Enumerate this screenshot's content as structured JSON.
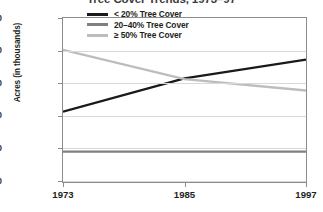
{
  "chart_data": {
    "type": "line",
    "title": "Tree Cover Trends, 1973–97",
    "xlabel": "",
    "ylabel": "Acres (in thousands)",
    "x": [
      1973,
      1985,
      1997
    ],
    "xlim": [
      1973,
      1997
    ],
    "ylim": [
      0,
      1000
    ],
    "xticks": [
      "1973",
      "1985",
      "1997"
    ],
    "yticks": [
      "0",
      "200",
      "400",
      "600",
      "800",
      "1000"
    ],
    "grid": true,
    "legend_position": "upper-right-inside",
    "series": [
      {
        "name": "< 20% Tree Cover",
        "color": "#1a1a1a",
        "values": [
          425,
          630,
          745
        ]
      },
      {
        "name": "20–40% Tree Cover",
        "color": "#808080",
        "values": [
          180,
          180,
          180
        ]
      },
      {
        "name": "≥ 50% Tree Cover",
        "color": "#bdbdbd",
        "values": [
          805,
          625,
          555
        ]
      }
    ]
  },
  "axes": {
    "y_ticks": [
      {
        "label": "1000",
        "value": 1000
      },
      {
        "label": "800",
        "value": 800
      },
      {
        "label": "600",
        "value": 600
      },
      {
        "label": "400",
        "value": 400
      },
      {
        "label": "200",
        "value": 200
      },
      {
        "label": "0",
        "value": 0
      }
    ],
    "x_ticks": [
      {
        "label": "1973",
        "value": 1973
      },
      {
        "label": "1985",
        "value": 1985
      },
      {
        "label": "1997",
        "value": 1997
      }
    ]
  },
  "legend": {
    "items": [
      {
        "label": "< 20% Tree Cover",
        "color": "#1a1a1a"
      },
      {
        "label": "20–40% Tree Cover",
        "color": "#808080"
      },
      {
        "label": "≥ 50% Tree Cover",
        "color": "#bdbdbd"
      }
    ]
  }
}
